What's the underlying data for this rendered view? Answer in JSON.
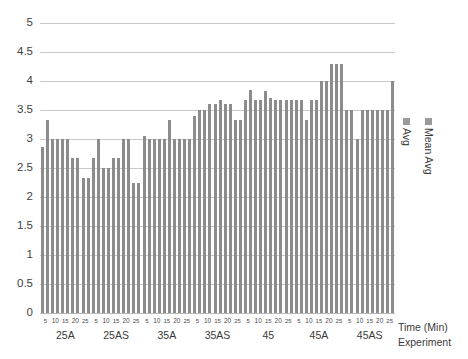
{
  "chart_data": {
    "type": "bar",
    "title": "",
    "xlabel": "Experiment",
    "xlabel2": "Time (Min)",
    "ylabel": "",
    "ylim": [
      0,
      5
    ],
    "ytick_step": 0.5,
    "grid": true,
    "legend_position": "right",
    "yticks": [
      "0",
      "0.5",
      "1",
      "1.5",
      "2",
      "2.5",
      "3",
      "3.5",
      "4",
      "4.5",
      "5"
    ],
    "time_ticks": [
      "5",
      "10",
      "15",
      "20",
      "25"
    ],
    "categories": [
      "25A",
      "25AS",
      "35A",
      "35AS",
      "45",
      "45A",
      "45AS"
    ],
    "series": [
      {
        "name": "Mean Avg",
        "color": "#8c8c8c",
        "values": [
          [
            2.87,
            3.0,
            3.0,
            2.67,
            2.33
          ],
          [
            2.67,
            2.5,
            2.67,
            3.0,
            2.25
          ],
          [
            3.05,
            3.0,
            3.0,
            3.0,
            3.0
          ],
          [
            3.4,
            3.5,
            3.6,
            3.6,
            3.33
          ],
          [
            3.67,
            3.67,
            3.83,
            3.67,
            3.67
          ],
          [
            3.67,
            3.33,
            3.67,
            4.0,
            4.3
          ],
          [
            3.5,
            3.0,
            3.5,
            3.5,
            3.5
          ]
        ]
      },
      {
        "name": "Avg",
        "color": "#8c8c8c",
        "values": [
          [
            3.32,
            3.0,
            3.0,
            2.67,
            2.33
          ],
          [
            3.0,
            2.5,
            2.67,
            3.0,
            2.25
          ],
          [
            3.0,
            3.0,
            3.33,
            3.0,
            3.0
          ],
          [
            3.5,
            3.6,
            3.67,
            3.6,
            3.33
          ],
          [
            3.85,
            3.67,
            3.7,
            3.67,
            3.67
          ],
          [
            3.67,
            3.67,
            4.0,
            4.3,
            4.3
          ],
          [
            3.5,
            3.5,
            3.5,
            3.5,
            4.0
          ]
        ]
      }
    ]
  },
  "legend": {
    "items": [
      {
        "label": "Avg",
        "color": "#9a9a9a"
      },
      {
        "label": "Mean Avg",
        "color": "#9a9a9a"
      }
    ]
  },
  "axis_titles": {
    "time": "Time (Min)",
    "experiment": "Experiment"
  }
}
